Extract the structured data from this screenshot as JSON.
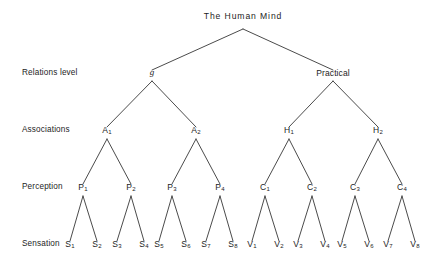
{
  "diagram": {
    "type": "hierarchical-tree",
    "title": "The Human Mind",
    "background_color": "#ffffff",
    "line_color": "#2b2b2b",
    "text_color": "#1d1d1d",
    "row_labels": [
      {
        "id": "relations",
        "label": "Relations level"
      },
      {
        "id": "associations",
        "label": "Associations"
      },
      {
        "id": "perception",
        "label": "Perception"
      },
      {
        "id": "sensation",
        "label": "Sensation"
      }
    ],
    "nodes": {
      "root": {
        "label": "The Human Mind",
        "base": "The Human Mind",
        "sub": ""
      },
      "relations": [
        {
          "label": "g",
          "base": "g",
          "sub": "",
          "italic": true
        },
        {
          "label": "Practical",
          "base": "Practical",
          "sub": "",
          "italic": false
        }
      ],
      "associations": [
        {
          "label": "A1",
          "base": "A",
          "sub": "1"
        },
        {
          "label": "A2",
          "base": "A",
          "sub": "2"
        },
        {
          "label": "H1",
          "base": "H",
          "sub": "1"
        },
        {
          "label": "H2",
          "base": "H",
          "sub": "2"
        }
      ],
      "perception": [
        {
          "label": "P1",
          "base": "P",
          "sub": "1"
        },
        {
          "label": "P2",
          "base": "P",
          "sub": "2"
        },
        {
          "label": "P3",
          "base": "P",
          "sub": "3"
        },
        {
          "label": "P4",
          "base": "P",
          "sub": "4"
        },
        {
          "label": "C1",
          "base": "C",
          "sub": "1"
        },
        {
          "label": "C2",
          "base": "C",
          "sub": "2"
        },
        {
          "label": "C3",
          "base": "C",
          "sub": "3"
        },
        {
          "label": "C4",
          "base": "C",
          "sub": "4"
        }
      ],
      "sensation": [
        {
          "label": "S1",
          "base": "S",
          "sub": "1"
        },
        {
          "label": "S2",
          "base": "S",
          "sub": "2"
        },
        {
          "label": "S3",
          "base": "S",
          "sub": "3"
        },
        {
          "label": "S4",
          "base": "S",
          "sub": "4"
        },
        {
          "label": "S5",
          "base": "S",
          "sub": "5"
        },
        {
          "label": "S6",
          "base": "S",
          "sub": "6"
        },
        {
          "label": "S7",
          "base": "S",
          "sub": "7"
        },
        {
          "label": "S8",
          "base": "S",
          "sub": "8"
        },
        {
          "label": "V1",
          "base": "V",
          "sub": "1"
        },
        {
          "label": "V2",
          "base": "V",
          "sub": "2"
        },
        {
          "label": "V3",
          "base": "V",
          "sub": "3"
        },
        {
          "label": "V4",
          "base": "V",
          "sub": "4"
        },
        {
          "label": "V5",
          "base": "V",
          "sub": "5"
        },
        {
          "label": "V6",
          "base": "V",
          "sub": "6"
        },
        {
          "label": "V7",
          "base": "V",
          "sub": "7"
        },
        {
          "label": "V8",
          "base": "V",
          "sub": "8"
        }
      ]
    }
  }
}
